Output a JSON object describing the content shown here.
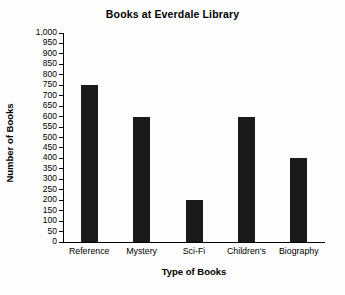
{
  "chart_data": {
    "type": "bar",
    "title": "Books at Everdale Library",
    "xlabel": "Type of Books",
    "ylabel": "Number of Books",
    "categories": [
      "Reference",
      "Mystery",
      "Sci-Fi",
      "Children's",
      "Biography"
    ],
    "values": [
      750,
      600,
      200,
      600,
      400
    ],
    "ylim": [
      0,
      1000
    ],
    "ytick_step": 50,
    "ytick_labels": [
      "0",
      "50",
      "100",
      "150",
      "200",
      "250",
      "300",
      "350",
      "400",
      "450",
      "500",
      "550",
      "600",
      "650",
      "700",
      "750",
      "800",
      "850",
      "900",
      "950",
      "1,000"
    ],
    "grid": false,
    "legend": false,
    "bar_color": "#1a1a1a",
    "axis_color": "#000000",
    "background_color": "#fdfdfd"
  }
}
